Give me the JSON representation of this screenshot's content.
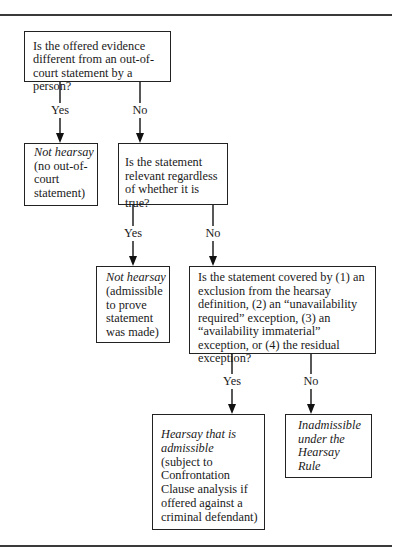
{
  "diagram": {
    "nodes": [
      {
        "id": "q1",
        "type": "question",
        "text": "Is the offered evidence different from an out-of-court statement by a person?"
      },
      {
        "id": "r1",
        "type": "result",
        "italic": "Not hearsay",
        "text": "(no out-of-court statement)"
      },
      {
        "id": "q2",
        "type": "question",
        "text": "Is the statement relevant regardless of whether it is true?"
      },
      {
        "id": "r2",
        "type": "result",
        "italic": "Not hearsay",
        "text": "(admissible to prove statement was made)"
      },
      {
        "id": "q3",
        "type": "question",
        "text": "Is the statement covered by (1) an exclusion from the hearsay definition, (2) an “unavailability required” exception, (3) an “availability immaterial” exception, or (4) the residual exception?"
      },
      {
        "id": "r3",
        "type": "result",
        "italic": "Hearsay that is admissible",
        "text": "(subject to Confrontation Clause analysis if offered against a criminal defendant)"
      },
      {
        "id": "r4",
        "type": "result",
        "italic": "Inadmissible under the Hearsay Rule",
        "text": ""
      }
    ],
    "edges": [
      {
        "from": "q1",
        "to": "r1",
        "label": "Yes"
      },
      {
        "from": "q1",
        "to": "q2",
        "label": "No"
      },
      {
        "from": "q2",
        "to": "r2",
        "label": "Yes"
      },
      {
        "from": "q2",
        "to": "q3",
        "label": "No"
      },
      {
        "from": "q3",
        "to": "r3",
        "label": "Yes"
      },
      {
        "from": "q3",
        "to": "r4",
        "label": "No"
      }
    ]
  },
  "labels": {
    "yes": "Yes",
    "no": "No"
  }
}
